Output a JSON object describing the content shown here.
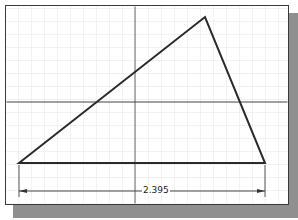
{
  "drawing": {
    "dimension": {
      "label": "2.395"
    },
    "triangle": {
      "vertices": [
        [
          19,
          163
        ],
        [
          205,
          17
        ],
        [
          265,
          163
        ]
      ],
      "stroke": "#2a2a2a"
    },
    "axes": {
      "x": 135,
      "y": 102,
      "color": "#555555"
    },
    "grid": {
      "color": "#e6e6e6",
      "spacing": 13
    },
    "colors": {
      "frame": "#3a3a3a",
      "shadow": "#8f8f8f",
      "background": "#ffffff"
    }
  }
}
